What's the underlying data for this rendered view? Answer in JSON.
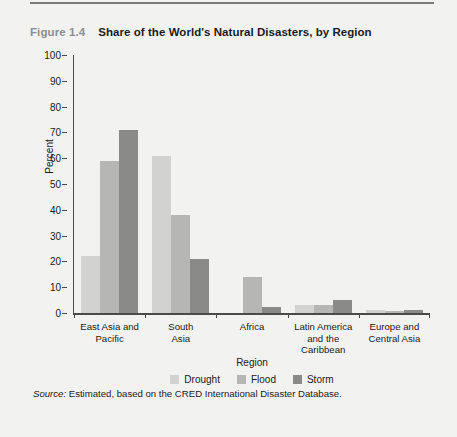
{
  "figure": {
    "number": "Figure 1.4",
    "title": "Share of the World's Natural Disasters, by Region",
    "source_label": "Source:",
    "source_text": " Estimated, based on the CRED International Disaster Database."
  },
  "colors": {
    "panel_background": "#f2f2f1",
    "axis": "#4a4a4a",
    "text": "#1b1b1b",
    "figure_number": "#8e8e8e",
    "drought": "#d2d2d0",
    "flood": "#b6b6b4",
    "storm": "#8a8a88"
  },
  "chart_data": {
    "type": "bar",
    "title": "Share of the World's Natural Disasters, by Region",
    "xlabel": "Region",
    "ylabel": "Percent",
    "ylim": [
      0,
      100
    ],
    "yticks": [
      0,
      10,
      20,
      30,
      40,
      50,
      60,
      70,
      80,
      90,
      100
    ],
    "grid": false,
    "legend_position": "bottom",
    "categories": [
      "East Asia and Pacific",
      "South Asia",
      "Africa",
      "Latin America and the Caribbean",
      "Europe and Central Asia"
    ],
    "category_label_lines": [
      [
        "East Asia and",
        "Pacific"
      ],
      [
        "South",
        "Asia"
      ],
      [
        "Africa"
      ],
      [
        "Latin America",
        "and the",
        "Caribbean"
      ],
      [
        "Europe and",
        "Central Asia"
      ]
    ],
    "series": [
      {
        "name": "Drought",
        "color": "#d2d2d0",
        "values": [
          22,
          61,
          0,
          3,
          1
        ]
      },
      {
        "name": "Flood",
        "color": "#b6b6b4",
        "values": [
          59,
          38,
          14,
          3,
          0.6
        ]
      },
      {
        "name": "Storm",
        "color": "#8a8a88",
        "values": [
          71,
          21,
          2.5,
          5,
          1
        ]
      }
    ]
  }
}
